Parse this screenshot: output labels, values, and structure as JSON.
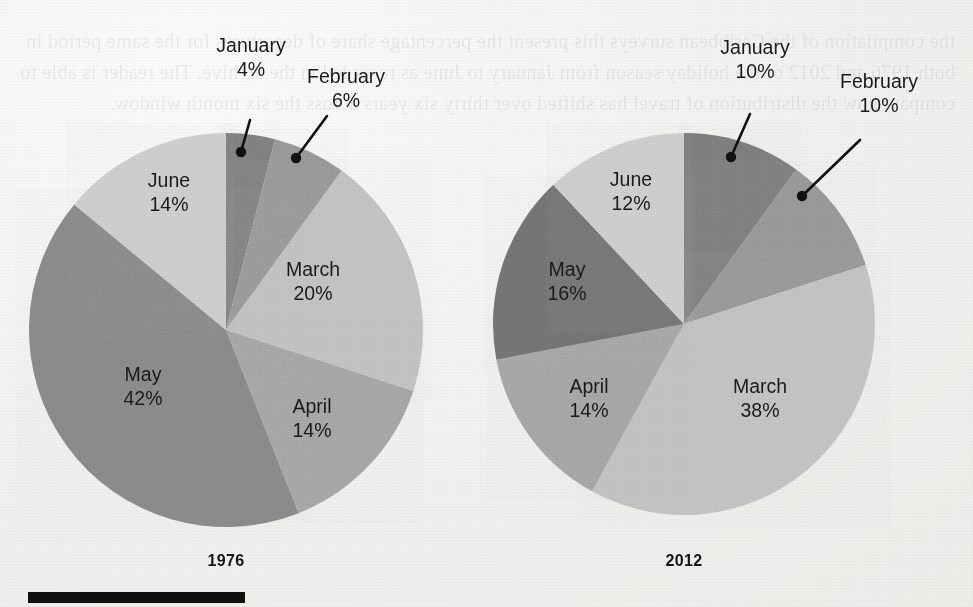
{
  "figure": {
    "background_color": "#f2f1ef",
    "scale_bar": {
      "name": "scale-bar",
      "color": "#111111"
    },
    "bleed_through_text": "the compilation of the Caribbean surveys this present the percentage share of departures for the same period in both 1976 and 2012 of the holiday season from January to June as recorded in the archive. The reader is able to compare how the distribution of travel has shifted over thirty six years across the six month window."
  },
  "chart_data": [
    {
      "type": "pie",
      "title": "1976",
      "categories": [
        "January",
        "February",
        "March",
        "April",
        "May",
        "June"
      ],
      "values": [
        4,
        6,
        20,
        14,
        42,
        14
      ],
      "value_suffix": "%",
      "start_angle_deg": 0,
      "direction": "clockwise",
      "legend": "none",
      "labels": [
        {
          "name": "January",
          "value": "4%",
          "text": "January",
          "pct": "4%",
          "placement": "callout"
        },
        {
          "name": "February",
          "value": "6%",
          "text": "February",
          "pct": "6%",
          "placement": "callout"
        },
        {
          "name": "March",
          "value": "20%",
          "text": "March",
          "pct": "20%",
          "placement": "inside"
        },
        {
          "name": "April",
          "value": "14%",
          "text": "April",
          "pct": "14%",
          "placement": "inside"
        },
        {
          "name": "May",
          "value": "42%",
          "text": "May",
          "pct": "42%",
          "placement": "inside"
        },
        {
          "name": "June",
          "value": "14%",
          "text": "June",
          "pct": "14%",
          "placement": "inside"
        }
      ],
      "colors": [
        "#808080",
        "#9a9a9a",
        "#c4c4c4",
        "#a8a8a8",
        "#8c8c8c",
        "#cfcfcf"
      ]
    },
    {
      "type": "pie",
      "title": "2012",
      "categories": [
        "January",
        "February",
        "March",
        "April",
        "May",
        "June"
      ],
      "values": [
        10,
        10,
        38,
        14,
        16,
        12
      ],
      "value_suffix": "%",
      "start_angle_deg": 0,
      "direction": "clockwise",
      "legend": "none",
      "labels": [
        {
          "name": "January",
          "value": "10%",
          "text": "January",
          "pct": "10%",
          "placement": "callout"
        },
        {
          "name": "February",
          "value": "10%",
          "text": "February",
          "pct": "10%",
          "placement": "callout"
        },
        {
          "name": "March",
          "value": "38%",
          "text": "March",
          "pct": "38%",
          "placement": "inside"
        },
        {
          "name": "April",
          "value": "14%",
          "text": "April",
          "pct": "14%",
          "placement": "inside"
        },
        {
          "name": "May",
          "value": "16%",
          "text": "May",
          "pct": "16%",
          "placement": "inside"
        },
        {
          "name": "June",
          "value": "12%",
          "text": "June",
          "pct": "12%",
          "placement": "inside"
        }
      ],
      "colors": [
        "#808080",
        "#9a9a9a",
        "#c4c4c4",
        "#a8a8a8",
        "#767676",
        "#cfcfcf"
      ]
    }
  ],
  "geometry": {
    "pies": [
      {
        "cx": 226,
        "cy": 330,
        "r": 197
      },
      {
        "cx": 684,
        "cy": 324,
        "r": 191
      }
    ],
    "year_label_y": [
      566,
      566
    ],
    "callouts": [
      [
        {
          "name": "January",
          "line": [
            [
              250,
              120
            ],
            [
              241,
              152
            ]
          ],
          "dot": [
            241,
            152
          ],
          "text_x": 251,
          "text_y": 52,
          "pct_y": 76
        },
        {
          "name": "February",
          "line": [
            [
              327,
              116
            ],
            [
              296,
              158
            ]
          ],
          "dot": [
            296,
            158
          ],
          "text_x": 346,
          "text_y": 83,
          "pct_y": 107
        }
      ],
      [
        {
          "name": "January",
          "line": [
            [
              750,
              114
            ],
            [
              731,
              157
            ]
          ],
          "dot": [
            731,
            157
          ],
          "text_x": 755,
          "text_y": 54,
          "pct_y": 78
        },
        {
          "name": "February",
          "line": [
            [
              860,
              140
            ],
            [
              802,
              196
            ]
          ],
          "dot": [
            802,
            196
          ],
          "text_x": 879,
          "text_y": 88,
          "pct_y": 112
        }
      ]
    ],
    "inside_labels": [
      [
        {
          "name": "March",
          "x": 313,
          "y": 276,
          "pct_y": 300
        },
        {
          "name": "April",
          "x": 312,
          "y": 413,
          "pct_y": 437
        },
        {
          "name": "May",
          "x": 143,
          "y": 381,
          "pct_y": 405
        },
        {
          "name": "June",
          "x": 169,
          "y": 187,
          "pct_y": 211
        }
      ],
      [
        {
          "name": "March",
          "x": 760,
          "y": 393,
          "pct_y": 417
        },
        {
          "name": "April",
          "x": 589,
          "y": 393,
          "pct_y": 417
        },
        {
          "name": "May",
          "x": 567,
          "y": 276,
          "pct_y": 300
        },
        {
          "name": "June",
          "x": 631,
          "y": 186,
          "pct_y": 210
        }
      ]
    ],
    "scale_bar": {
      "x": 28,
      "y": 592,
      "width": 217,
      "height": 11
    }
  }
}
